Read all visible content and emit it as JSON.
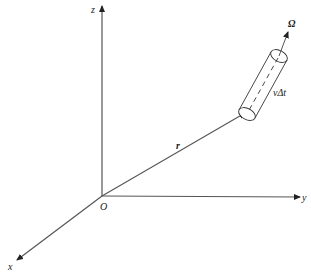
{
  "diagram": {
    "type": "3d-coordinate-system",
    "colors": {
      "line": "#333333",
      "background": "#ffffff"
    },
    "axes": {
      "z": {
        "label": "z"
      },
      "y": {
        "label": "y"
      },
      "x": {
        "label": "x"
      },
      "origin": {
        "label": "O"
      }
    },
    "vectors": {
      "position": {
        "label": "r"
      },
      "direction": {
        "label": "Ω"
      }
    },
    "cylinder": {
      "length_label": "vΔt"
    }
  }
}
